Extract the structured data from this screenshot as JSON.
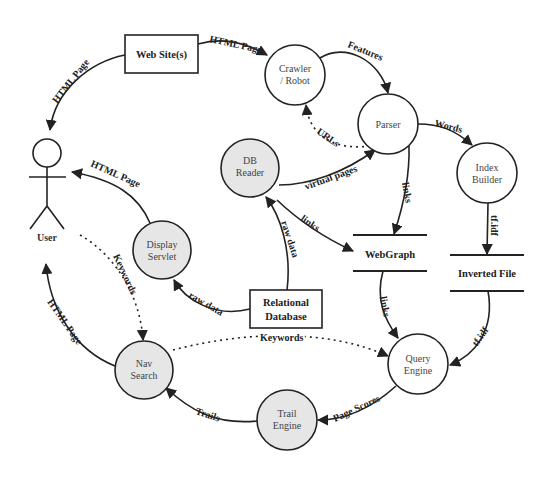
{
  "diagram": {
    "type": "data-flow-diagram",
    "colors": {
      "stroke": "#222222",
      "process_fill": "#ffffff",
      "process_fill_shaded": "#e6e6e6",
      "background": "#ffffff"
    },
    "actors": [
      {
        "id": "user",
        "label": "User"
      }
    ],
    "external_entities": [
      {
        "id": "website",
        "label": "Web Site(s)"
      },
      {
        "id": "reldb",
        "label_line1": "Relational",
        "label_line2": "Database"
      }
    ],
    "processes": [
      {
        "id": "crawler",
        "line1": "Crawler",
        "line2": "/ Robot",
        "shaded": false
      },
      {
        "id": "parser",
        "line1": "Parser",
        "line2": "",
        "shaded": false
      },
      {
        "id": "indexbuilder",
        "line1": "Index",
        "line2": "Builder",
        "shaded": false
      },
      {
        "id": "dbreader",
        "line1": "DB",
        "line2": "Reader",
        "shaded": true
      },
      {
        "id": "displayservlet",
        "line1": "Display",
        "line2": "Servlet",
        "shaded": true
      },
      {
        "id": "navsearch",
        "line1": "Nav",
        "line2": "Search",
        "shaded": true
      },
      {
        "id": "queryengine",
        "line1": "Query",
        "line2": "Engine",
        "shaded": false
      },
      {
        "id": "trailengine",
        "line1": "Trail",
        "line2": "Engine",
        "shaded": true
      }
    ],
    "data_stores": [
      {
        "id": "webgraph",
        "label": "WebGraph"
      },
      {
        "id": "invertedfile",
        "label": "Inverted File"
      }
    ],
    "edges": [
      {
        "from": "website",
        "to": "crawler",
        "label": "HTML Page",
        "style": "solid"
      },
      {
        "from": "website",
        "to": "user",
        "label": "HTML Page",
        "style": "solid"
      },
      {
        "from": "crawler",
        "to": "parser",
        "label": "Features",
        "style": "solid"
      },
      {
        "from": "parser",
        "to": "crawler",
        "label": "URLs",
        "style": "dotted"
      },
      {
        "from": "parser",
        "to": "indexbuilder",
        "label": "Words",
        "style": "solid"
      },
      {
        "from": "parser",
        "to": "webgraph",
        "label": "links",
        "style": "solid"
      },
      {
        "from": "dbreader",
        "to": "parser",
        "label": "virtual pages",
        "style": "solid"
      },
      {
        "from": "dbreader",
        "to": "webgraph",
        "label": "links",
        "style": "solid"
      },
      {
        "from": "reldb",
        "to": "dbreader",
        "label": "raw data",
        "style": "solid"
      },
      {
        "from": "reldb",
        "to": "displayservlet",
        "label": "raw data",
        "style": "solid"
      },
      {
        "from": "displayservlet",
        "to": "user",
        "label": "HTML Page",
        "style": "solid"
      },
      {
        "from": "indexbuilder",
        "to": "invertedfile",
        "label": "tf.idf",
        "style": "solid"
      },
      {
        "from": "webgraph",
        "to": "queryengine",
        "label": "links",
        "style": "solid"
      },
      {
        "from": "invertedfile",
        "to": "queryengine",
        "label": "tf.idf",
        "style": "solid"
      },
      {
        "from": "user",
        "to": "navsearch",
        "label": "Keywords",
        "style": "dotted"
      },
      {
        "from": "navsearch",
        "to": "queryengine",
        "label": "Keywords",
        "style": "dotted"
      },
      {
        "from": "queryengine",
        "to": "trailengine",
        "label": "Page Scores",
        "style": "solid"
      },
      {
        "from": "trailengine",
        "to": "navsearch",
        "label": "Trails",
        "style": "solid"
      },
      {
        "from": "navsearch",
        "to": "user",
        "label": "HTML Page",
        "style": "solid"
      }
    ]
  }
}
